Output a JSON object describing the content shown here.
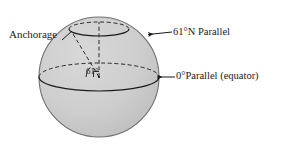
{
  "figure": {
    "type": "diagram",
    "labels": {
      "anchorage": "Anchorage",
      "parallel_61n": "61°N Parallel",
      "parallel_0": "0°Parallel (equator)",
      "center_angle": "61°"
    },
    "colors": {
      "sphere_fill": "#cccccc",
      "sphere_edge": "#7a7a7a",
      "line": "#1a1a1a",
      "text": "#1a1a1a",
      "background": "#ffffff"
    },
    "geometry": {
      "sphere_center_x": 99,
      "sphere_center_y": 77,
      "sphere_radius": 60,
      "equator_ry": 14,
      "parallel61_cy": 29,
      "parallel61_rx": 30,
      "parallel61_ry": 7
    }
  }
}
